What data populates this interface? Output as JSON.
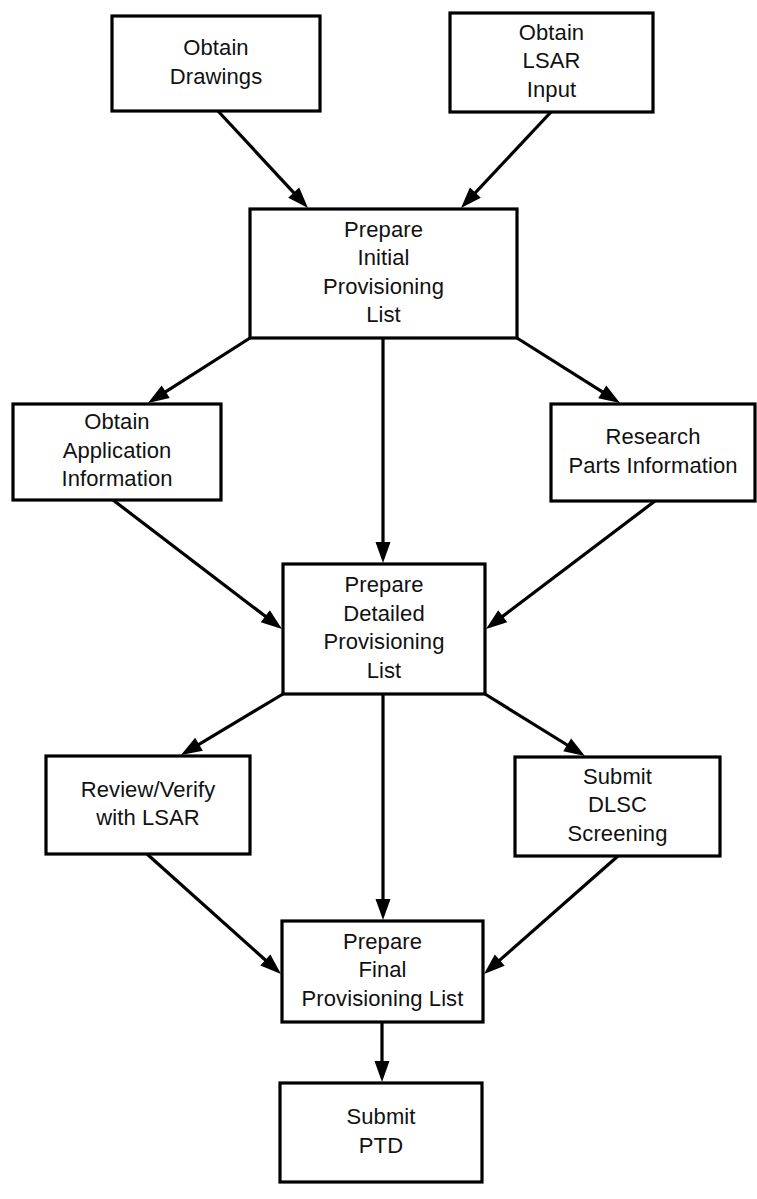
{
  "diagram": {
    "background_color": "#ffffff",
    "line_color": "#000000",
    "text_color": "#111111",
    "nodes": [
      {
        "id": "obtain-drawings",
        "lines": [
          "Obtain",
          "Drawings"
        ],
        "x": 112,
        "y": 16,
        "w": 208,
        "h": 95
      },
      {
        "id": "obtain-lsar-input",
        "lines": [
          "Obtain",
          "LSAR",
          "Input"
        ],
        "x": 450,
        "y": 13,
        "w": 203,
        "h": 99
      },
      {
        "id": "prepare-initial-provisioning-list",
        "lines": [
          "Prepare",
          "Initial",
          "Provisioning",
          "List"
        ],
        "x": 250,
        "y": 209,
        "w": 267,
        "h": 129
      },
      {
        "id": "obtain-application-information",
        "lines": [
          "Obtain",
          "Application",
          "Information"
        ],
        "x": 13,
        "y": 404,
        "w": 208,
        "h": 96
      },
      {
        "id": "research-parts-information",
        "lines": [
          "Research",
          "Parts Information"
        ],
        "x": 551,
        "y": 404,
        "w": 204,
        "h": 97
      },
      {
        "id": "prepare-detailed-provisioning-list",
        "lines": [
          "Prepare",
          "Detailed",
          "Provisioning",
          "List"
        ],
        "x": 283,
        "y": 564,
        "w": 202,
        "h": 130
      },
      {
        "id": "review-verify-with-lsar",
        "lines": [
          "Review/Verify",
          "with LSAR"
        ],
        "x": 46,
        "y": 756,
        "w": 204,
        "h": 98
      },
      {
        "id": "submit-dlsc-screening",
        "lines": [
          "Submit",
          "DLSC",
          "Screening"
        ],
        "x": 515,
        "y": 757,
        "w": 205,
        "h": 99
      },
      {
        "id": "prepare-final-provisioning-list",
        "lines": [
          "Prepare",
          "Final",
          "Provisioning List"
        ],
        "x": 282,
        "y": 921,
        "w": 201,
        "h": 101
      },
      {
        "id": "submit-ptd",
        "lines": [
          "Submit",
          "PTD"
        ],
        "x": 280,
        "y": 1083,
        "w": 202,
        "h": 99
      }
    ],
    "edges": [
      {
        "id": "drawings-to-initial",
        "from": "obtain-drawings",
        "to": "prepare-initial-provisioning-list",
        "x1": 218,
        "y1": 111,
        "x2": 308,
        "y2": 208
      },
      {
        "id": "lsar-input-to-initial",
        "from": "obtain-lsar-input",
        "to": "prepare-initial-provisioning-list",
        "x1": 551,
        "y1": 112,
        "x2": 461,
        "y2": 208
      },
      {
        "id": "initial-to-application",
        "from": "prepare-initial-provisioning-list",
        "to": "obtain-application-information",
        "x1": 250,
        "y1": 338,
        "x2": 148,
        "y2": 403
      },
      {
        "id": "initial-to-detailed",
        "from": "prepare-initial-provisioning-list",
        "to": "prepare-detailed-provisioning-list",
        "x1": 383,
        "y1": 338,
        "x2": 383,
        "y2": 563
      },
      {
        "id": "initial-to-research",
        "from": "prepare-initial-provisioning-list",
        "to": "research-parts-information",
        "x1": 517,
        "y1": 338,
        "x2": 620,
        "y2": 403
      },
      {
        "id": "application-to-detailed",
        "from": "obtain-application-information",
        "to": "prepare-detailed-provisioning-list",
        "x1": 113,
        "y1": 500,
        "x2": 282,
        "y2": 629
      },
      {
        "id": "research-to-detailed",
        "from": "research-parts-information",
        "to": "prepare-detailed-provisioning-list",
        "x1": 655,
        "y1": 501,
        "x2": 486,
        "y2": 629
      },
      {
        "id": "detailed-to-review",
        "from": "prepare-detailed-provisioning-list",
        "to": "review-verify-with-lsar",
        "x1": 283,
        "y1": 694,
        "x2": 181,
        "y2": 755
      },
      {
        "id": "detailed-to-final",
        "from": "prepare-detailed-provisioning-list",
        "to": "prepare-final-provisioning-list",
        "x1": 383,
        "y1": 694,
        "x2": 383,
        "y2": 920
      },
      {
        "id": "detailed-to-dlsc",
        "from": "prepare-detailed-provisioning-list",
        "to": "submit-dlsc-screening",
        "x1": 485,
        "y1": 694,
        "x2": 585,
        "y2": 756
      },
      {
        "id": "review-to-final",
        "from": "review-verify-with-lsar",
        "to": "prepare-final-provisioning-list",
        "x1": 147,
        "y1": 854,
        "x2": 281,
        "y2": 974
      },
      {
        "id": "dlsc-to-final",
        "from": "submit-dlsc-screening",
        "to": "prepare-final-provisioning-list",
        "x1": 618,
        "y1": 856,
        "x2": 484,
        "y2": 974
      },
      {
        "id": "final-to-ptd",
        "from": "prepare-final-provisioning-list",
        "to": "submit-ptd",
        "x1": 382,
        "y1": 1022,
        "x2": 382,
        "y2": 1082
      }
    ]
  }
}
